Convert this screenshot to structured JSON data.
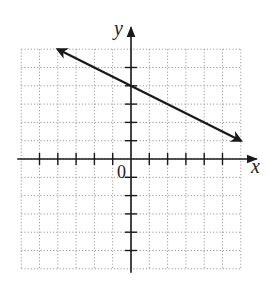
{
  "chart_data": {
    "type": "line",
    "title": "",
    "xlabel": "x",
    "ylabel": "y",
    "origin_label": "0",
    "xlim": [
      -6,
      6
    ],
    "ylim": [
      -6,
      6
    ],
    "grid": true,
    "grid_style": "dotted",
    "tick_spacing": 1,
    "series": [
      {
        "name": "line",
        "equation": "y = -x/2 + 4",
        "slope": -0.5,
        "y_intercept": 4,
        "points": [
          [
            -4,
            6
          ],
          [
            0,
            4
          ],
          [
            6,
            1
          ]
        ],
        "arrows": "both"
      }
    ],
    "colors": {
      "line": "#1a1a1a",
      "axes": "#1a1a1a",
      "grid": "#9a9a9a"
    }
  }
}
